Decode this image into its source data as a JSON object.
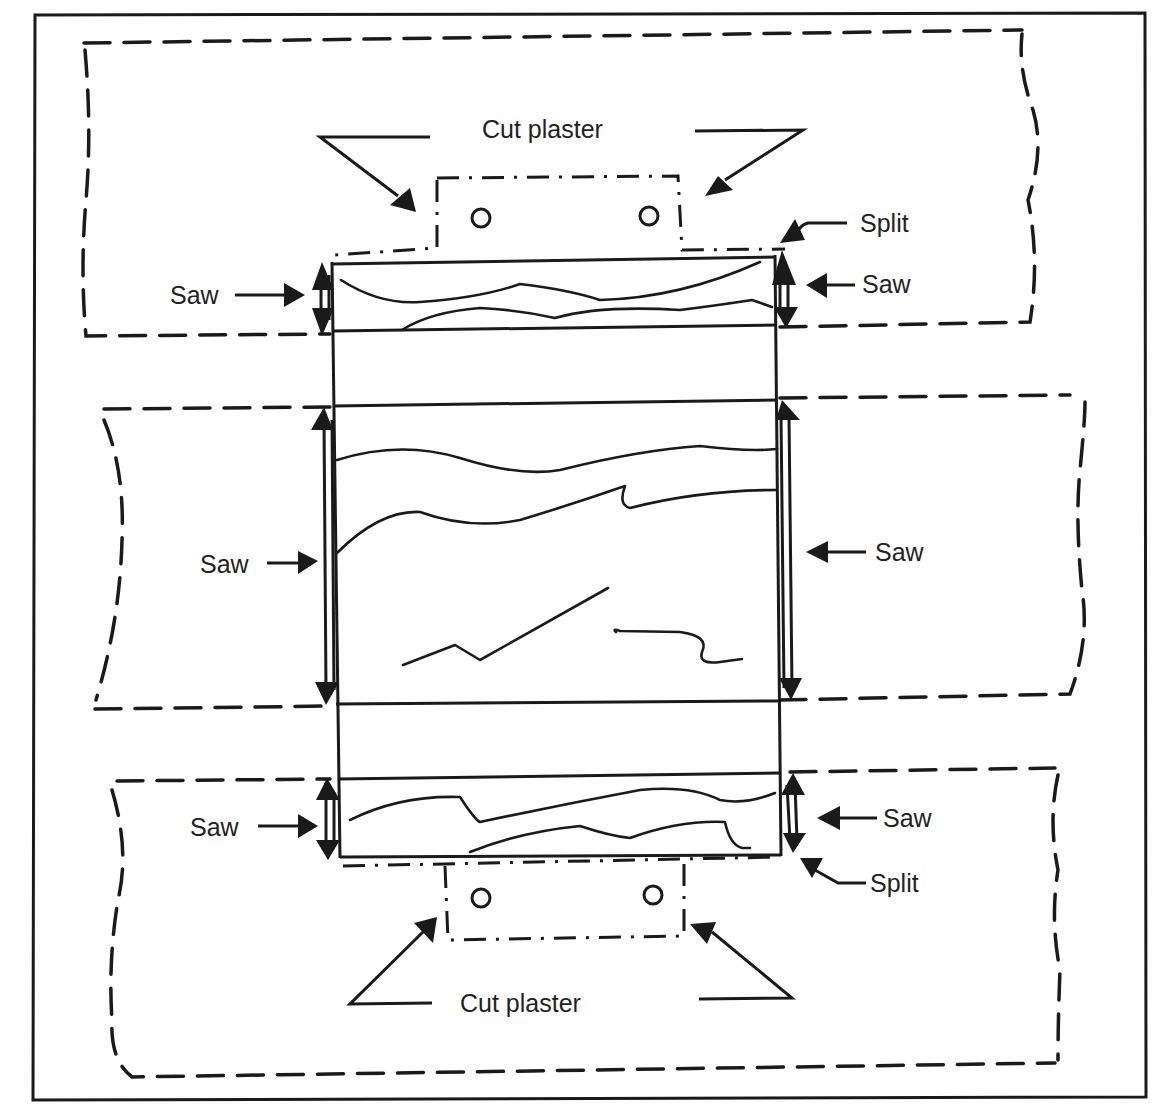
{
  "figure": {
    "type": "technical diagram",
    "labels": {
      "cut_plaster_top": "Cut plaster",
      "cut_plaster_bottom": "Cut plaster",
      "split_top": "Split",
      "split_bottom": "Split",
      "saw_top_left": "Saw",
      "saw_top_right": "Saw",
      "saw_middle_left": "Saw",
      "saw_middle_right": "Saw",
      "saw_bottom_left": "Saw",
      "saw_bottom_right": "Saw"
    },
    "regions": [
      {
        "name": "top plaster band",
        "style": "dashed outline"
      },
      {
        "name": "middle plaster band",
        "style": "dashed outline"
      },
      {
        "name": "bottom plaster band",
        "style": "dashed outline"
      },
      {
        "name": "top cut plaster tab",
        "style": "dash-dot outline",
        "holes": 2
      },
      {
        "name": "bottom cut plaster tab",
        "style": "dash-dot outline",
        "holes": 2
      },
      {
        "name": "central specimen block",
        "style": "solid outline",
        "segments": 3
      }
    ],
    "caption_note": "caption text partially cropped at bottom edge",
    "colors": {
      "ink": "#1a1a1a",
      "background": "#ffffff"
    }
  }
}
